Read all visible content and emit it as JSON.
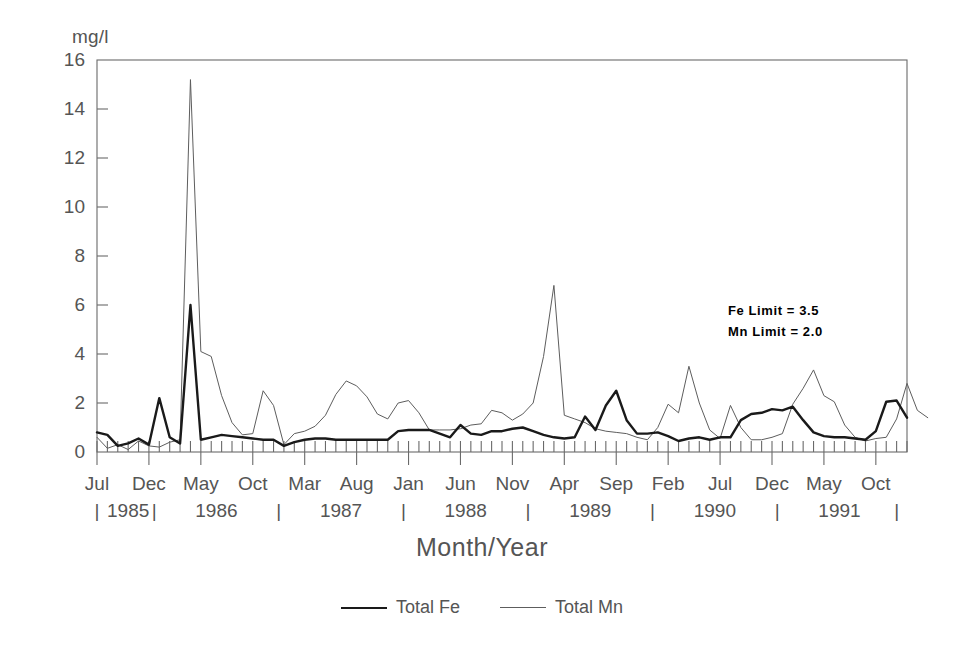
{
  "chart_data": {
    "type": "line",
    "title": "",
    "xlabel": "Month/Year",
    "ylabel": "mg/l",
    "ylim": [
      0,
      16
    ],
    "ytick_values": [
      0,
      2,
      4,
      6,
      8,
      10,
      12,
      14,
      16
    ],
    "ytick_labels": [
      "0",
      "2",
      "4",
      "6",
      "8",
      "10",
      "12",
      "14",
      "16"
    ],
    "grid": false,
    "legend_position": "below plot, centered",
    "x_start": "Jul 1985",
    "x_end": "Nov 1991",
    "x_interval": "monthly",
    "xtick_labels": [
      "Jul",
      "Dec",
      "May",
      "Oct",
      "Mar",
      "Aug",
      "Jan",
      "Jun",
      "Nov",
      "Apr",
      "Sep",
      "Feb",
      "Jul",
      "Dec",
      "May",
      "Oct"
    ],
    "xtick_indices": [
      0,
      5,
      10,
      15,
      20,
      25,
      30,
      35,
      40,
      45,
      50,
      55,
      60,
      65,
      70,
      75
    ],
    "year_labels": [
      "1985",
      "1986",
      "1987",
      "1988",
      "1989",
      "1990",
      "1991"
    ],
    "year_label_indices": [
      3,
      11.5,
      23.5,
      35.5,
      47.5,
      59.5,
      71.5
    ],
    "year_separator_indices": [
      -0.5,
      5.5,
      17.5,
      29.5,
      41.5,
      53.5,
      65.5,
      77
    ],
    "annotations": [
      {
        "text": "Fe Limit = 3.5",
        "value": 3.5
      },
      {
        "text": "Mn Limit = 2.0",
        "value": 2.0
      }
    ],
    "series": [
      {
        "name": "Total Fe",
        "color": "#1a1a1a",
        "width": 2.4,
        "values": [
          0.8,
          0.7,
          0.25,
          0.35,
          0.55,
          0.3,
          2.2,
          0.6,
          0.35,
          6.0,
          0.5,
          0.6,
          0.7,
          0.65,
          0.6,
          0.55,
          0.5,
          0.5,
          0.25,
          0.4,
          0.5,
          0.55,
          0.55,
          0.5,
          0.5,
          0.5,
          0.5,
          0.5,
          0.5,
          0.85,
          0.9,
          0.9,
          0.9,
          0.75,
          0.6,
          1.1,
          0.75,
          0.7,
          0.85,
          0.85,
          0.95,
          1.0,
          0.85,
          0.7,
          0.6,
          0.55,
          0.6,
          1.45,
          0.9,
          1.9,
          2.5,
          1.3,
          0.75,
          0.75,
          0.8,
          0.65,
          0.45,
          0.55,
          0.6,
          0.5,
          0.6,
          0.6,
          1.3,
          1.55,
          1.6,
          1.75,
          1.7,
          1.85,
          1.3,
          0.8,
          0.65,
          0.6,
          0.6,
          0.55,
          0.5,
          0.85,
          2.05,
          2.1,
          1.4
        ]
      },
      {
        "name": "Total Mn",
        "color": "#5d5d5d",
        "width": 1.0,
        "values": [
          0.6,
          0.15,
          0.3,
          0.1,
          0.45,
          0.25,
          0.2,
          0.4,
          0.5,
          15.2,
          4.1,
          3.9,
          2.3,
          1.2,
          0.7,
          0.75,
          2.5,
          1.9,
          0.3,
          0.75,
          0.85,
          1.05,
          1.5,
          2.35,
          2.9,
          2.7,
          2.25,
          1.55,
          1.35,
          2.0,
          2.1,
          1.6,
          0.9,
          0.9,
          0.9,
          0.95,
          1.1,
          1.15,
          1.7,
          1.6,
          1.3,
          1.55,
          2.0,
          3.9,
          6.8,
          1.5,
          1.35,
          1.2,
          0.95,
          0.85,
          0.8,
          0.75,
          0.6,
          0.5,
          1.0,
          1.95,
          1.6,
          3.5,
          2.0,
          0.9,
          0.55,
          1.9,
          1.0,
          0.5,
          0.5,
          0.6,
          0.75,
          1.95,
          2.6,
          3.35,
          2.3,
          2.05,
          1.1,
          0.6,
          0.45,
          0.55,
          0.6,
          1.35,
          2.8,
          1.7,
          1.4
        ]
      }
    ]
  },
  "axis": {
    "unit_label": "mg/l",
    "x_title": "Month/Year"
  },
  "limits": {
    "fe": "Fe Limit = 3.5",
    "mn": "Mn Limit = 2.0"
  },
  "legend": {
    "items": [
      {
        "label": "Total Fe"
      },
      {
        "label": "Total Mn"
      }
    ]
  }
}
